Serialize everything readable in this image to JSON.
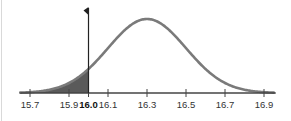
{
  "chart_data": {
    "type": "area",
    "title": "",
    "xlabel": "",
    "ylabel": "",
    "distribution": "normal",
    "mean": 16.3,
    "std_dev": 0.2,
    "xlim": [
      15.65,
      16.95
    ],
    "x_ticks": [
      15.7,
      15.9,
      16.0,
      16.1,
      16.3,
      16.5,
      16.7,
      16.9
    ],
    "tick_labels": [
      "15.7",
      "15.9",
      "16.0",
      "16.1",
      "16.3",
      "16.5",
      "16.7",
      "16.9"
    ],
    "highlighted_tick": "16.0",
    "marker_line": {
      "x": 16.0,
      "flag": "left-pointing"
    },
    "shaded_region": {
      "from": 15.65,
      "to": 16.0,
      "description": "left tail area below 16.0"
    },
    "grid": false,
    "legend": null,
    "colors": {
      "curve": "#7a7a7a",
      "shade": "#5a5a5a",
      "axis": "#444444",
      "marker": "#222222"
    }
  }
}
